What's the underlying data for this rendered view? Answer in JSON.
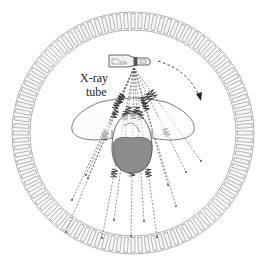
{
  "diagram": {
    "title": "",
    "labels": {
      "tube_line1": "X-ray",
      "tube_line2": "tube"
    },
    "components": [
      {
        "id": "detector-ring",
        "description": "circular ring of detector elements surrounding the patient"
      },
      {
        "id": "xray-tube",
        "description": "X-ray source at top of gantry"
      },
      {
        "id": "rotation-arrow",
        "description": "dashed curved arrow indicating clockwise rotation of tube"
      },
      {
        "id": "fan-beam",
        "description": "diverging X-ray beams from tube passing through patient"
      },
      {
        "id": "patient-head",
        "description": "patient cross-section with shaded region"
      },
      {
        "id": "scatter-shape",
        "description": "wing-shaped outline around patient"
      }
    ],
    "geometry": {
      "center": [
        133,
        133
      ],
      "ring_outer_radius": 121,
      "ring_inner_radius": 103,
      "detector_count": 100,
      "tube_focus": [
        134,
        68
      ]
    },
    "colors": {
      "ring_stroke": "#9a9a9a",
      "ring_fill": "#f4f4f4",
      "line": "#444444",
      "head_fill": "#8c8c8c",
      "photon": "#333333"
    }
  }
}
